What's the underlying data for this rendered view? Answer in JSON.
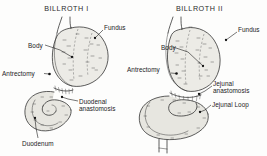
{
  "figure": {
    "name": "billroth-gastrectomy-reconstruction-diagram",
    "background_color": "#fdfdfc",
    "ink_color": "#2a2a2a",
    "organ_fill_color": "#ecebe6",
    "width": 267,
    "height": 156
  },
  "panels": [
    {
      "id": "billroth-1",
      "title": "BILLROTH I",
      "labels": [
        {
          "id": "fundus",
          "text": "Fundus",
          "x": 104,
          "y": 24,
          "anchor_x": 95,
          "anchor_y": 38
        },
        {
          "id": "body",
          "text": "Body",
          "x": 28,
          "y": 42,
          "anchor_x": 72,
          "anchor_y": 57
        },
        {
          "id": "antrectomy",
          "text": "Antrectomy",
          "x": 2,
          "y": 70,
          "anchor_x": 49,
          "anchor_y": 74
        },
        {
          "id": "duodenal-anastomosis",
          "text": "Duodenal anastomosis",
          "x": 79,
          "y": 98,
          "anchor_x": 62,
          "anchor_y": 99
        },
        {
          "id": "duodenum",
          "text": "Duodenum",
          "x": 22,
          "y": 140,
          "anchor_x": 35,
          "anchor_y": 118
        }
      ]
    },
    {
      "id": "billroth-2",
      "title": "BILLROTH II",
      "labels": [
        {
          "id": "fundus",
          "text": "Fundus",
          "x": 238,
          "y": 26,
          "anchor_x": 226,
          "anchor_y": 40
        },
        {
          "id": "body",
          "text": "Body",
          "x": 161,
          "y": 44,
          "anchor_x": 203,
          "anchor_y": 66
        },
        {
          "id": "antrectomy",
          "text": "Antrectomy",
          "x": 127,
          "y": 66,
          "anchor_x": 176,
          "anchor_y": 73
        },
        {
          "id": "jejunal-anastomosis",
          "text": "Jejunal anastomosis",
          "x": 213,
          "y": 80,
          "anchor_x": 203,
          "anchor_y": 94
        },
        {
          "id": "jejunal-loop",
          "text": "Jejunal Loop",
          "x": 212,
          "y": 101,
          "anchor_x": 200,
          "anchor_y": 112
        }
      ]
    }
  ]
}
